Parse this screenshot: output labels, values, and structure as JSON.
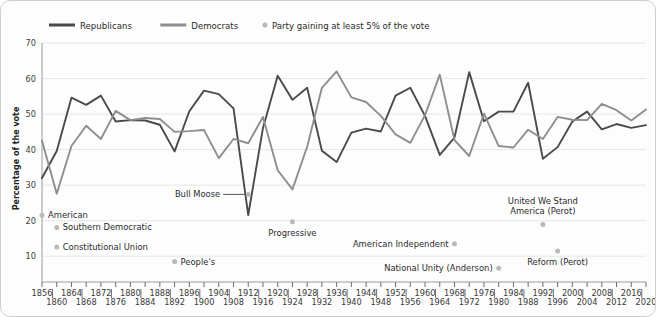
{
  "legend": {
    "items": [
      {
        "label": "Republicans",
        "type": "line",
        "color": "#4a4a4a"
      },
      {
        "label": "Democrats",
        "type": "line",
        "color": "#8e8e8e"
      },
      {
        "label": "Party gaining at least 5% of the vote",
        "type": "dot",
        "color": "#b9b9b9"
      }
    ]
  },
  "axes": {
    "ylabel": "Percentage of the vote",
    "yticks": [
      10,
      20,
      30,
      40,
      50,
      60,
      70
    ],
    "ylim": [
      5,
      70
    ],
    "xlim": [
      1856,
      2020
    ]
  },
  "chart_data": {
    "type": "line",
    "title": "",
    "xlabel": "",
    "ylabel": "Percentage of the vote",
    "ylim": [
      5,
      70
    ],
    "grid": true,
    "legend_position": "top-left",
    "x": [
      1856,
      1860,
      1864,
      1868,
      1872,
      1876,
      1880,
      1884,
      1888,
      1892,
      1896,
      1900,
      1904,
      1908,
      1912,
      1916,
      1920,
      1924,
      1928,
      1932,
      1936,
      1940,
      1944,
      1948,
      1952,
      1956,
      1960,
      1964,
      1968,
      1972,
      1976,
      1980,
      1984,
      1988,
      1992,
      1996,
      2000,
      2004,
      2008,
      2012,
      2016,
      2020
    ],
    "xtick_labels_top": [
      "1856",
      "1864",
      "1872",
      "1880",
      "1888",
      "1896",
      "1904",
      "1912",
      "1920",
      "1928",
      "1936",
      "1944",
      "1952",
      "1960",
      "1968",
      "1976",
      "1984",
      "1992",
      "2000",
      "2008",
      "2016"
    ],
    "xtick_labels_bottom": [
      "1860",
      "1868",
      "1876",
      "1884",
      "1892",
      "1900",
      "1908",
      "1916",
      "1924",
      "1932",
      "1940",
      "1948",
      "1956",
      "1964",
      "1972",
      "1980",
      "1988",
      "1996",
      "2004",
      "2012",
      "2020"
    ],
    "series": [
      {
        "name": "Republicans",
        "color": "#4a4a4a",
        "values": [
          32.0,
          39.6,
          54.6,
          52.6,
          55.2,
          47.9,
          48.3,
          48.2,
          47.0,
          39.5,
          50.8,
          56.6,
          55.6,
          51.6,
          21.6,
          46.1,
          60.8,
          54.0,
          57.4,
          39.7,
          36.5,
          44.8,
          45.9,
          45.1,
          55.2,
          57.4,
          49.5,
          38.5,
          43.4,
          61.8,
          48.0,
          50.7,
          50.7,
          58.8,
          37.4,
          40.7,
          47.9,
          50.7,
          45.7,
          47.2,
          46.1,
          46.9
        ]
      },
      {
        "name": "Democrats",
        "color": "#8e8e8e",
        "values": [
          42.5,
          27.6,
          41.0,
          46.7,
          43.0,
          50.9,
          48.3,
          48.9,
          48.6,
          45.0,
          45.2,
          45.5,
          37.6,
          43.0,
          41.8,
          49.2,
          34.2,
          28.8,
          40.8,
          57.4,
          62.0,
          54.7,
          53.4,
          49.5,
          44.3,
          41.9,
          49.7,
          61.1,
          42.7,
          38.2,
          50.1,
          41.0,
          40.6,
          45.6,
          43.0,
          49.2,
          48.4,
          48.3,
          52.9,
          51.1,
          48.2,
          51.3
        ]
      }
    ],
    "third_parties": [
      {
        "label": "American",
        "year": 1856,
        "value": 21.5,
        "dot_side": "left",
        "lines": [
          "American"
        ]
      },
      {
        "label": "Southern Democratic",
        "year": 1860,
        "value": 18.1,
        "dot_side": "left",
        "lines": [
          "Southern Democratic"
        ]
      },
      {
        "label": "Constitutional Union",
        "year": 1860,
        "value": 12.6,
        "dot_side": "left",
        "lines": [
          "Constitutional Union"
        ]
      },
      {
        "label": "People's",
        "year": 1892,
        "value": 8.5,
        "dot_side": "left",
        "lines": [
          "People's"
        ]
      },
      {
        "label": "Bull Moose",
        "year": 1912,
        "value": 27.4,
        "dot_side": "leader",
        "lines": [
          "Bull Moose"
        ]
      },
      {
        "label": "Progressive",
        "year": 1924,
        "value": 16.6,
        "dot_side": "above",
        "lines": [
          "Progressive"
        ]
      },
      {
        "label": "American Independent",
        "year": 1968,
        "value": 13.5,
        "dot_side": "right",
        "lines": [
          "American Independent"
        ]
      },
      {
        "label": "National Unity (Anderson)",
        "year": 1980,
        "value": 6.6,
        "dot_side": "right",
        "lines": [
          "National Unity (Anderson)"
        ]
      },
      {
        "label": "United We Stand America (Perot)",
        "year": 1992,
        "value": 18.9,
        "dot_side": "below",
        "lines": [
          "United We Stand",
          "America (Perot)"
        ]
      },
      {
        "label": "Reform (Perot)",
        "year": 1996,
        "value": 8.4,
        "dot_side": "above",
        "lines": [
          "Reform (Perot)"
        ]
      }
    ]
  },
  "colors": {
    "republican": "#4a4a4a",
    "democrat": "#8e8e8e",
    "third_party_dot": "#b9b9b9",
    "grid": "#e6e6e6",
    "frame": "#cfcfcf"
  }
}
